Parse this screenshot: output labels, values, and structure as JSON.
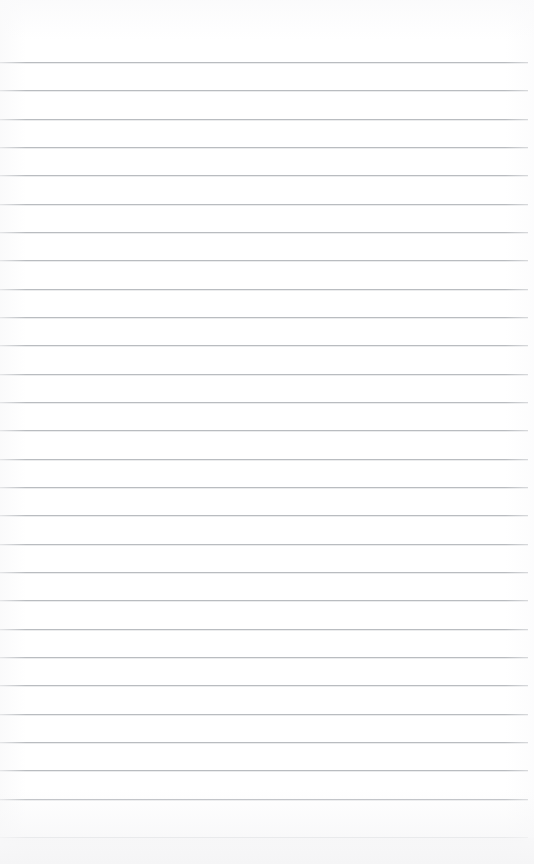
{
  "page": {
    "kind": "lined-paper-sheet",
    "width_px": 534,
    "height_px": 864,
    "background_color": "#ffffff",
    "bottom_band_color": "#f5f5f6"
  },
  "ruling": {
    "line_color": "#b9bcc0",
    "line_highlight_color": "#ebeced",
    "line_thickness_px": 1,
    "line_spacing_px": 28.3,
    "first_line_y_px": 62,
    "last_line_y_px": 837,
    "line_count": 28,
    "line_left_x_px": 0,
    "line_right_x_px": 528,
    "line_width_px": 528
  },
  "margins": {
    "top_blank_px": 61,
    "bottom_blank_px": 27,
    "left_px": 0,
    "right_px": 6
  },
  "content": {
    "written_text": "",
    "note": ""
  },
  "lines": [
    {
      "index": 1,
      "y": 62,
      "text": ""
    },
    {
      "index": 2,
      "y": 90,
      "text": ""
    },
    {
      "index": 3,
      "y": 119,
      "text": ""
    },
    {
      "index": 4,
      "y": 147,
      "text": ""
    },
    {
      "index": 5,
      "y": 175,
      "text": ""
    },
    {
      "index": 6,
      "y": 204,
      "text": ""
    },
    {
      "index": 7,
      "y": 232,
      "text": ""
    },
    {
      "index": 8,
      "y": 260,
      "text": ""
    },
    {
      "index": 9,
      "y": 289,
      "text": ""
    },
    {
      "index": 10,
      "y": 317,
      "text": ""
    },
    {
      "index": 11,
      "y": 345,
      "text": ""
    },
    {
      "index": 12,
      "y": 374,
      "text": ""
    },
    {
      "index": 13,
      "y": 402,
      "text": ""
    },
    {
      "index": 14,
      "y": 430,
      "text": ""
    },
    {
      "index": 15,
      "y": 459,
      "text": ""
    },
    {
      "index": 16,
      "y": 487,
      "text": ""
    },
    {
      "index": 17,
      "y": 515,
      "text": ""
    },
    {
      "index": 18,
      "y": 544,
      "text": ""
    },
    {
      "index": 19,
      "y": 572,
      "text": ""
    },
    {
      "index": 20,
      "y": 600,
      "text": ""
    },
    {
      "index": 21,
      "y": 629,
      "text": ""
    },
    {
      "index": 22,
      "y": 657,
      "text": ""
    },
    {
      "index": 23,
      "y": 685,
      "text": ""
    },
    {
      "index": 24,
      "y": 714,
      "text": ""
    },
    {
      "index": 25,
      "y": 742,
      "text": ""
    },
    {
      "index": 26,
      "y": 770,
      "text": ""
    },
    {
      "index": 27,
      "y": 799,
      "text": ""
    },
    {
      "index": 28,
      "y": 837,
      "text": ""
    }
  ]
}
